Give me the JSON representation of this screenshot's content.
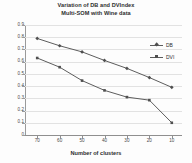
{
  "chart_data": {
    "type": "line",
    "title": "Variation of DB and DVIndex",
    "subtitle": "Multi-SOM with Wine data",
    "xlabel": "Number of clusters",
    "ylabel": "",
    "categories": [
      "70",
      "60",
      "50",
      "40",
      "30",
      "20",
      "10"
    ],
    "x": [
      70,
      60,
      50,
      40,
      30,
      20,
      10
    ],
    "xlim": [
      70,
      10
    ],
    "ylim": [
      0,
      0.9
    ],
    "yticks": [
      "0",
      "0.1",
      "0.2",
      "0.3",
      "0.4",
      "0.5",
      "0.6",
      "0.7",
      "0.8",
      "0.9"
    ],
    "ytick_values": [
      0,
      0.1,
      0.2,
      0.3,
      0.4,
      0.5,
      0.6,
      0.7,
      0.8,
      0.9
    ],
    "grid": "horizontal",
    "legend_position": "inside-right",
    "series": [
      {
        "name": "DB",
        "marker": "diamond",
        "color": "#4f4f4f",
        "values": [
          0.79,
          0.73,
          0.68,
          0.61,
          0.545,
          0.47,
          0.39
        ]
      },
      {
        "name": "DVI",
        "marker": "square",
        "color": "#4f4f4f",
        "values": [
          0.63,
          0.555,
          0.445,
          0.365,
          0.31,
          0.285,
          0.1
        ]
      }
    ]
  },
  "legend": {
    "items": [
      {
        "label": "DB"
      },
      {
        "label": "DVI"
      }
    ]
  },
  "colors": {
    "series_line": "#5d5d5d",
    "grid": "#e2e2e2",
    "axis": "#8f8f8f",
    "text": "#2e2e2e",
    "background": "#fdfdfd"
  }
}
